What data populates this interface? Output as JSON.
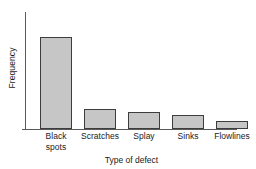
{
  "chart_data": {
    "type": "bar",
    "title": "",
    "subtitle": "",
    "categories": [
      "Black\nspots",
      "Scratches",
      "Splay",
      "Sinks",
      "Flowlines"
    ],
    "category_labels_flat": [
      "Black spots",
      "Scratches",
      "Splay",
      "Sinks",
      "Flowlines"
    ],
    "values": [
      92,
      20,
      17,
      14,
      8
    ],
    "xlabel": "Type of defect",
    "ylabel": "Frequency",
    "ylim": [
      0,
      117
    ],
    "xlim": [
      0,
      5
    ],
    "y_tick_labels": [],
    "x_tick_labels": [
      "Black spots",
      "Scratches",
      "Splay",
      "Sinks",
      "Flowlines"
    ],
    "grid": false,
    "legend": false,
    "legend_position": "none",
    "annotations": [],
    "series": [
      {
        "name": "Frequency",
        "values": [
          92,
          20,
          17,
          14,
          8
        ]
      }
    ],
    "colors": {
      "bar_fill": "#c6c6c6",
      "bar_border": "#3d3d3d",
      "axis": "#5a5a5a",
      "text": "#1a1a1a",
      "background": "#ffffff"
    },
    "bar_layout": {
      "bar_width_px": 32,
      "gap_px": 12,
      "left_offsets_px": [
        14,
        58,
        102,
        146,
        190
      ]
    }
  }
}
